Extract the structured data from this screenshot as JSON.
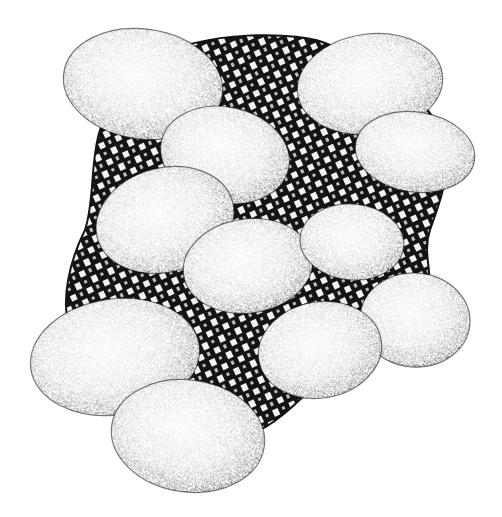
{
  "image": {
    "title": "Stippled eggs on a checkered cloth",
    "description": "Pen-and-ink stipple illustration of thirteen eggs resting on a black-and-white checkered cloth",
    "width": 502,
    "height": 517,
    "background": "#ffffff",
    "ink": "#141414",
    "paper": "#ffffff"
  },
  "cloth": {
    "path": "M 150 60 C 200 30, 300 30, 330 45 C 380 60, 420 90, 440 130 C 455 170, 440 200, 430 230 C 420 260, 440 280, 420 300 C 390 330, 350 350, 320 380 C 300 400, 280 420, 260 430 L 200 430 C 150 420, 90 380, 70 330 C 60 300, 70 260, 85 230 C 95 200, 90 160, 100 130 C 110 100, 130 75, 150 60 Z",
    "pattern_size": 9
  },
  "eggs": [
    {
      "name": "egg-top-left",
      "cx": 143,
      "cy": 84,
      "rx": 80,
      "ry": 55,
      "rot": 8
    },
    {
      "name": "egg-top-right",
      "cx": 370,
      "cy": 84,
      "rx": 73,
      "ry": 50,
      "rot": -8
    },
    {
      "name": "egg-upper-center",
      "cx": 225,
      "cy": 155,
      "rx": 65,
      "ry": 48,
      "rot": 12
    },
    {
      "name": "egg-right-upper",
      "cx": 415,
      "cy": 152,
      "rx": 60,
      "ry": 40,
      "rot": 8
    },
    {
      "name": "egg-mid-left",
      "cx": 165,
      "cy": 220,
      "rx": 70,
      "ry": 52,
      "rot": -15
    },
    {
      "name": "egg-center",
      "cx": 248,
      "cy": 266,
      "rx": 65,
      "ry": 47,
      "rot": -8
    },
    {
      "name": "egg-mid-right",
      "cx": 352,
      "cy": 242,
      "rx": 52,
      "ry": 38,
      "rot": 5
    },
    {
      "name": "egg-right-lower",
      "cx": 415,
      "cy": 320,
      "rx": 55,
      "ry": 47,
      "rot": 5
    },
    {
      "name": "egg-lower-center",
      "cx": 320,
      "cy": 350,
      "rx": 62,
      "ry": 48,
      "rot": -10
    },
    {
      "name": "egg-bottom-left",
      "cx": 115,
      "cy": 357,
      "rx": 85,
      "ry": 58,
      "rot": -8
    },
    {
      "name": "egg-bottom",
      "cx": 188,
      "cy": 436,
      "rx": 77,
      "ry": 56,
      "rot": 8
    }
  ]
}
